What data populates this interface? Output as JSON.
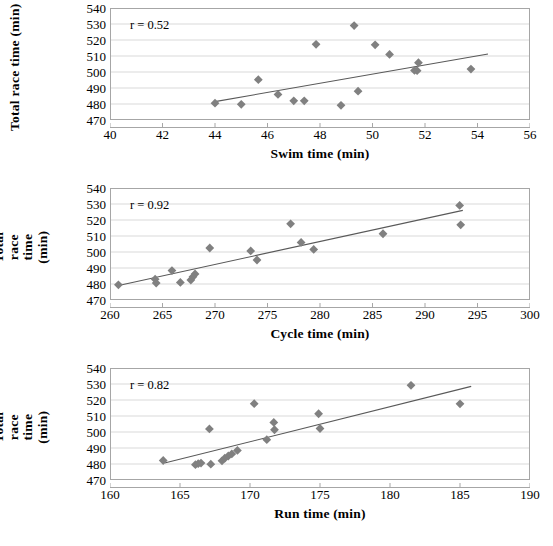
{
  "figure": {
    "marker_color": "#808080",
    "trendline_color": "#595959",
    "grid_color": "#d9d9d9",
    "axis_color": "#a6a6a6",
    "text_color": "#000000",
    "background": "#ffffff"
  },
  "chart_data": [
    {
      "type": "scatter",
      "title": "",
      "xlabel": "Swim time (min)",
      "ylabel": "Total race time (min)",
      "ylabel_lines": [
        "Total race time (min)"
      ],
      "annotation": "r = 0.52",
      "correlation": 0.52,
      "xlim": [
        40,
        56
      ],
      "ylim": [
        470,
        540
      ],
      "xticks": [
        40,
        42,
        44,
        46,
        48,
        50,
        52,
        54,
        56
      ],
      "xtick_labels": [
        "40",
        "42",
        "44",
        "46",
        "48",
        "50",
        "52",
        "54",
        "56"
      ],
      "yticks": [
        470,
        480,
        490,
        500,
        510,
        520,
        530,
        540
      ],
      "ytick_labels": [
        "470",
        "480",
        "490",
        "500",
        "510",
        "520",
        "530",
        "540"
      ],
      "grid": "horizontal",
      "legend": "none",
      "x": [
        44.0,
        45.0,
        45.65,
        46.4,
        47.0,
        47.4,
        47.85,
        48.8,
        49.3,
        49.45,
        50.1,
        50.65,
        51.6,
        51.7,
        51.75,
        53.75
      ],
      "y": [
        480.5,
        479.8,
        495.2,
        486.0,
        482.0,
        482.0,
        517.3,
        479.2,
        529.0,
        488.0,
        517.0,
        511.0,
        501.0,
        500.8,
        505.8,
        501.8
      ],
      "trendline": {
        "x1": 44.0,
        "y1": 481.5,
        "x2": 54.4,
        "y2": 511.3
      }
    },
    {
      "type": "scatter",
      "title": "",
      "xlabel": "Cycle time (min)",
      "ylabel": "Total race time (min)",
      "ylabel_lines": [
        "Total race time",
        "(min)"
      ],
      "annotation": "r = 0.92",
      "correlation": 0.92,
      "xlim": [
        260,
        300
      ],
      "ylim": [
        470,
        540
      ],
      "xticks": [
        260,
        265,
        270,
        275,
        280,
        285,
        290,
        295,
        300
      ],
      "xtick_labels": [
        "260",
        "265",
        "270",
        "275",
        "280",
        "285",
        "290",
        "295",
        "300"
      ],
      "yticks": [
        470,
        480,
        490,
        500,
        510,
        520,
        530,
        540
      ],
      "ytick_labels": [
        "470",
        "480",
        "490",
        "500",
        "510",
        "520",
        "530",
        "540"
      ],
      "grid": "horizontal",
      "legend": "none",
      "x": [
        260.8,
        264.3,
        264.4,
        265.9,
        266.7,
        267.7,
        267.9,
        268.1,
        269.5,
        273.4,
        274.0,
        277.2,
        278.2,
        279.4,
        286.0,
        293.3,
        293.4
      ],
      "y": [
        479.5,
        483.0,
        480.6,
        488.4,
        481.0,
        482.5,
        484.5,
        486.3,
        502.5,
        500.7,
        495.0,
        517.6,
        506.0,
        501.6,
        511.4,
        529.1,
        517.0
      ],
      "trendline": {
        "x1": 260.6,
        "y1": 478.8,
        "x2": 293.6,
        "y2": 526.0
      }
    },
    {
      "type": "scatter",
      "title": "",
      "xlabel": "Run time (min)",
      "ylabel": "Total race time (min)",
      "ylabel_lines": [
        "Total race time",
        "(min)"
      ],
      "annotation": "r = 0.82",
      "correlation": 0.82,
      "xlim": [
        160,
        190
      ],
      "ylim": [
        470,
        540
      ],
      "xticks": [
        160,
        165,
        170,
        175,
        180,
        185,
        190
      ],
      "xtick_labels": [
        "160",
        "165",
        "170",
        "175",
        "180",
        "185",
        "190"
      ],
      "yticks": [
        470,
        480,
        490,
        500,
        510,
        520,
        530,
        540
      ],
      "ytick_labels": [
        "470",
        "480",
        "490",
        "500",
        "510",
        "520",
        "530",
        "540"
      ],
      "grid": "horizontal",
      "legend": "none",
      "x": [
        163.8,
        166.1,
        166.3,
        166.5,
        167.1,
        167.2,
        168.0,
        168.2,
        168.45,
        168.7,
        169.1,
        171.2,
        170.3,
        171.7,
        171.75,
        174.9,
        175.0,
        181.5,
        185.0
      ],
      "y": [
        482.2,
        479.6,
        480.2,
        480.6,
        501.9,
        479.9,
        482.0,
        483.6,
        485.0,
        486.3,
        488.5,
        495.2,
        517.7,
        506.0,
        501.4,
        511.4,
        502.2,
        529.2,
        517.6
      ],
      "trendline": {
        "x1": 163.9,
        "y1": 480.6,
        "x2": 185.8,
        "y2": 528.5
      }
    }
  ]
}
